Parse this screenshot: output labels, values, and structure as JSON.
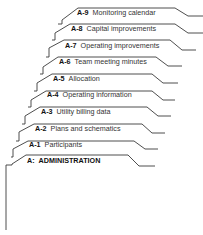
{
  "tabs": [
    {
      "code": "A-9",
      "title": "Monitoring calendar"
    },
    {
      "code": "A-8",
      "title": "Capital improvements"
    },
    {
      "code": "A-7",
      "title": "Operating improvements"
    },
    {
      "code": "A-6",
      "title": "Team meeting minutes"
    },
    {
      "code": "A-5",
      "title": "Allocation"
    },
    {
      "code": "A-4",
      "title": "Operating information"
    },
    {
      "code": "A-3",
      "title": "Utility billing data"
    },
    {
      "code": "A-2",
      "title": "Plans and schematics"
    },
    {
      "code": "A-1",
      "title": "Participants"
    },
    {
      "code": "A:",
      "title": "ADMINISTRATION"
    }
  ],
  "colors": {
    "line": "#3a3a3a",
    "background": "#ffffff"
  }
}
